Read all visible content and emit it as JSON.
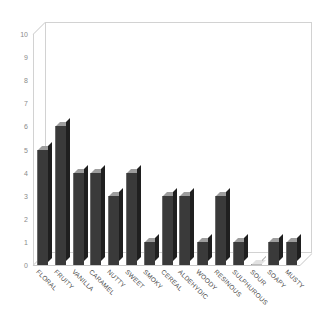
{
  "chart_data": {
    "type": "bar",
    "title": "",
    "subtitle": "",
    "xlabel": "",
    "ylabel": "",
    "ylim": [
      0,
      10
    ],
    "yticks": [
      "0",
      "1",
      "2",
      "3",
      "4",
      "5",
      "6",
      "7",
      "8",
      "9",
      "10"
    ],
    "grid": false,
    "legend": false,
    "legend_position": "none",
    "style": "3d-bar",
    "bar_color": "#3a3a3a",
    "bar_side_color": "#1f1f1f",
    "bar_top_color": "#9d9d9d",
    "frame_color": "#d2d2d2",
    "tick_label_color": "#8a8a8a",
    "category_label_color": "#4a4a4a",
    "categories": [
      "FLORAL",
      "FRUITY",
      "VANILLA",
      "CARAMEL",
      "NUTTY",
      "SWEET",
      "SMOKY",
      "CEREAL",
      "ALDEHYDIC",
      "WOODY",
      "RESINOUS",
      "SULPHUROUS",
      "SOUR",
      "SOAPY",
      "MUSTY"
    ],
    "values": [
      5,
      6,
      4,
      4,
      3,
      4,
      1,
      3,
      3,
      1,
      3,
      1,
      0,
      1,
      1
    ]
  }
}
